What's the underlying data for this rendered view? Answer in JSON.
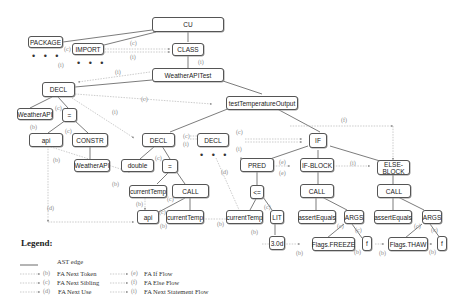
{
  "diagram": {
    "nodes": {
      "cu": "CU",
      "package": "PACKAGE",
      "import": "IMPORT",
      "class": "CLASS",
      "weatherapitest": "WeatherAPITest",
      "decl1": "DECL",
      "testtemp": "testTemperatureOutput",
      "weatherapi1": "WeatherAPI",
      "assign1": "=",
      "api1": "api",
      "constr": "CONSTR",
      "weatherapi2": "WeatherAPI",
      "decl2": "DECL",
      "decl3": "DECL",
      "double": "double",
      "assign2": "=",
      "currenttemp1": "currentTemp",
      "call1": "CALL",
      "api2": "api",
      "currenttemp2": "currentTemp",
      "if": "IF",
      "pred": "PRED",
      "ifblock": "IF-BLOCK",
      "elseblock_l1": "ELSE-",
      "elseblock_l2": "BLOCK",
      "le": "<=",
      "currenttemp3": "currentTemp",
      "lit": "LIT",
      "val": "3.0d",
      "call2": "CALL",
      "call3": "CALL",
      "assertequals1": "assertEquals",
      "args1": "ARGS",
      "assertequals2": "assertEquals",
      "args2": "ARGS",
      "flagsfreeze": "Flags.FREEZE",
      "f1": "f",
      "flagsthaw": "Flags.THAW",
      "f2": "f"
    },
    "ellipsis": "• • •",
    "edge_labels": {
      "b": "(b)",
      "c": "(c)",
      "d": "(d)",
      "e": "(e)",
      "f": "(f)",
      "i": "(i)"
    }
  },
  "legend": {
    "title": "Legend:",
    "items": [
      {
        "key": "",
        "label": "AST edge"
      },
      {
        "key": "(b)",
        "label": "FA Next Token"
      },
      {
        "key": "(c)",
        "label": "FA Next Sibling"
      },
      {
        "key": "(d)",
        "label": "FA Next Use"
      },
      {
        "key": "(e)",
        "label": "FA If Flow"
      },
      {
        "key": "(f)",
        "label": "FA Else Flow"
      },
      {
        "key": "(i)",
        "label": "FA Next Statement Flow"
      }
    ]
  },
  "colors": {
    "ast_edge": "#444444",
    "flow_edge": "#aaaaaa",
    "node_border": "#555555"
  }
}
